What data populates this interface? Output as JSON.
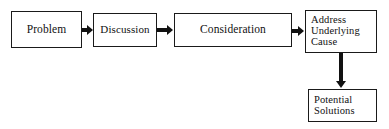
{
  "diagram": {
    "type": "flowchart",
    "title": "",
    "background_color": "#ffffff",
    "stroke_color": "#1a1a1a",
    "text_color": "#111111",
    "nodes": [
      {
        "id": "problem",
        "label": "Problem",
        "shape": "rectangle",
        "align": "center",
        "x": 11,
        "y": 11,
        "w": 71,
        "h": 37,
        "font_size": 11.5
      },
      {
        "id": "discussion",
        "label": "Discussion",
        "shape": "rectangle",
        "align": "center",
        "x": 93,
        "y": 13,
        "w": 64,
        "h": 34,
        "font_size": 11
      },
      {
        "id": "consideration",
        "label": "Consideration",
        "shape": "rectangle",
        "align": "center",
        "x": 174,
        "y": 13,
        "w": 118,
        "h": 34,
        "font_size": 11.5
      },
      {
        "id": "address-underlying-cause",
        "label": "Address\nUnderlying\nCause",
        "shape": "rectangle",
        "align": "left",
        "x": 305,
        "y": 10,
        "w": 72,
        "h": 43,
        "font_size": 10.5
      },
      {
        "id": "potential-solutions",
        "label": "Potential\nSolutions",
        "shape": "rectangle",
        "align": "left",
        "x": 308,
        "y": 89,
        "w": 69,
        "h": 33,
        "font_size": 10.5
      }
    ],
    "edges": [
      {
        "id": "problem-to-discussion",
        "from": "problem",
        "to": "discussion",
        "orientation": "horizontal",
        "label": "",
        "x": 82,
        "y": 30,
        "length": 11
      },
      {
        "id": "discussion-to-consideration",
        "from": "discussion",
        "to": "consideration",
        "orientation": "horizontal",
        "label": "",
        "x": 157,
        "y": 30,
        "length": 17
      },
      {
        "id": "consideration-to-address",
        "from": "consideration",
        "to": "address-underlying-cause",
        "orientation": "horizontal",
        "label": "",
        "x": 292,
        "y": 31,
        "length": 13
      },
      {
        "id": "address-to-potential",
        "from": "address-underlying-cause",
        "to": "potential-solutions",
        "orientation": "vertical",
        "label": "",
        "x": 341,
        "y": 53,
        "length": 36
      }
    ]
  }
}
